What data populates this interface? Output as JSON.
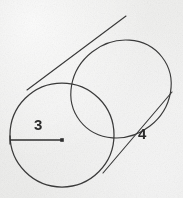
{
  "figure": {
    "kind": "geometry-diagram",
    "background_color": "#f0f0ef",
    "stroke_color": "#3a3a3a",
    "label_color": "#2b2b2b",
    "width": 183,
    "height": 198
  },
  "labels": {
    "radius": "3",
    "slant": "4"
  },
  "annotations": {
    "radius_label_meaning": "radius of the circular base",
    "slant_label_meaning": "length along the side of the cylinder"
  },
  "geometry": {
    "near_circle": {
      "cx": 62,
      "cy": 135,
      "r": 52
    },
    "far_ellipse": {
      "cx": 121,
      "cy": 89,
      "rx": 52,
      "ry": 47,
      "rotation_deg": -38
    },
    "radius_line": {
      "x1": 10,
      "y1": 140,
      "x2": 62,
      "y2": 140
    },
    "center_dot": {
      "cx": 62,
      "cy": 140,
      "size": 3
    },
    "upper_side_line": {
      "x1": 27,
      "y1": 90,
      "x2": 126,
      "y2": 16
    },
    "lower_side_line": {
      "x1": 103,
      "y1": 173,
      "x2": 172,
      "y2": 92
    }
  }
}
